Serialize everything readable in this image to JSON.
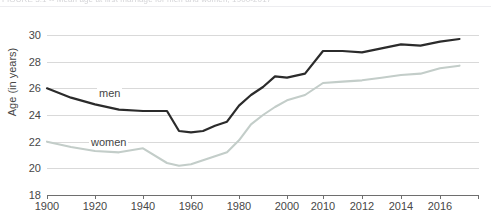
{
  "caption": {
    "text": "FIGURE 3.1 -- Mean age at first marriage for men and women, 1900-2017"
  },
  "axes": {
    "ylabel": "Age (in years)",
    "xlabel": "",
    "yticks": [
      18,
      20,
      22,
      24,
      26,
      28,
      30
    ],
    "xticks": [
      "1900",
      "1920",
      "1940",
      "1960",
      "1980",
      "2000",
      "2010",
      "2012",
      "2014",
      "2016"
    ]
  },
  "series_labels": {
    "men": "men",
    "women": "women"
  },
  "colors": {
    "men": "#2b2b2b",
    "women": "#c3cdc9",
    "grid": "#d9d9d9",
    "axis": "#6e6e6e",
    "text": "#474747"
  },
  "chart_data": {
    "type": "line",
    "title": "",
    "xlabel": "",
    "ylabel": "Age (in years)",
    "ylim": [
      18,
      30
    ],
    "grid": true,
    "legend": "inline-labels",
    "axis_note": "x-axis is non-linear: 20-year steps from 1900 to 2000, then 2-year steps from 2010 to 2017",
    "x": [
      1900,
      1910,
      1920,
      1930,
      1940,
      1950,
      1955,
      1960,
      1965,
      1970,
      1975,
      1980,
      1985,
      1990,
      1995,
      2000,
      2005,
      2010,
      2011,
      2012,
      2013,
      2014,
      2015,
      2016,
      2017
    ],
    "xticks_positions": [
      "1900",
      "1920",
      "1940",
      "1960",
      "1980",
      "2000",
      "2010",
      "2012",
      "2014",
      "2016"
    ],
    "series": [
      {
        "name": "men",
        "color": "#2b2b2b",
        "values": [
          26.0,
          25.3,
          24.8,
          24.4,
          24.3,
          24.3,
          22.8,
          22.7,
          22.8,
          23.2,
          23.5,
          24.7,
          25.5,
          26.1,
          26.9,
          26.8,
          27.1,
          28.8,
          28.8,
          28.7,
          29.0,
          29.3,
          29.2,
          29.5,
          29.7
        ]
      },
      {
        "name": "women",
        "color": "#c3cdc9",
        "values": [
          22.0,
          21.6,
          21.3,
          21.2,
          21.5,
          20.4,
          20.2,
          20.3,
          20.6,
          20.9,
          21.2,
          22.1,
          23.3,
          24.0,
          24.6,
          25.1,
          25.5,
          26.4,
          26.5,
          26.6,
          26.8,
          27.0,
          27.1,
          27.5,
          27.7
        ]
      }
    ]
  }
}
